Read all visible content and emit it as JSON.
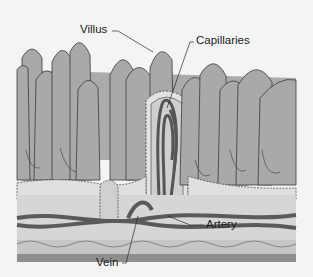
{
  "diagram": {
    "labels": {
      "villus": "Villus",
      "capillaries": "Capillaries",
      "artery": "Artery",
      "vein": "Vein"
    },
    "colors": {
      "background": "#f4f4f4",
      "villus_fill": "#a9a9a9",
      "outline": "#3a3a3a",
      "vessel": "#5a5a5a",
      "submucosa": "#d6d6d6",
      "muscle_layer": "#8e8e8e",
      "epithelium": "#e2e2e2"
    }
  }
}
